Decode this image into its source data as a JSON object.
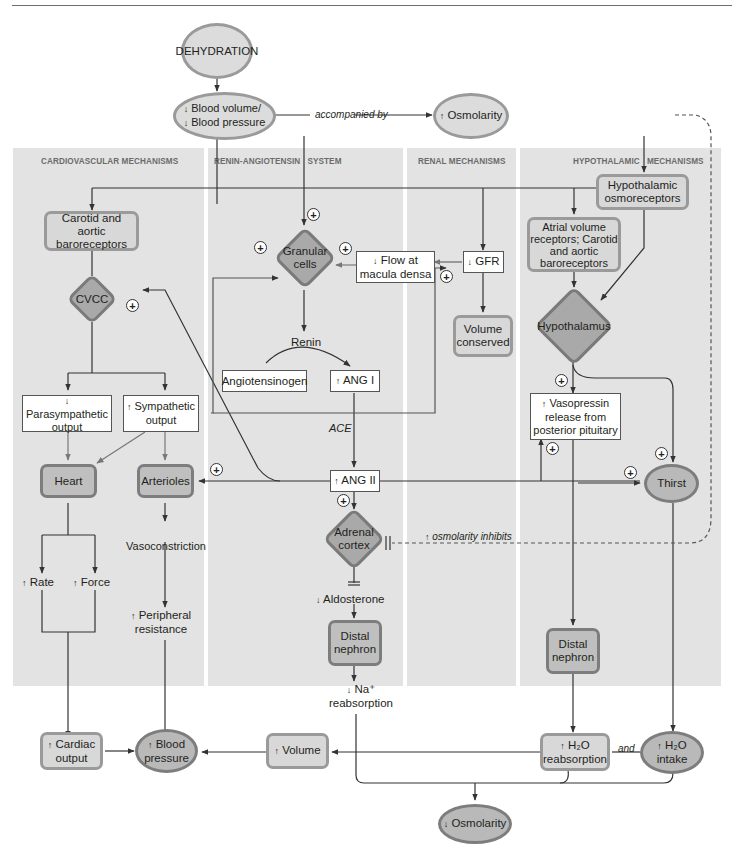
{
  "diagram": {
    "colors": {
      "band_background": "#e3e3e3",
      "node_light": "#dcdcdc",
      "node_dark": "#b9b9b9",
      "diamond_fill": "#a9a9a9",
      "border": "#9a9a9a",
      "line": "#333333",
      "section_title": "#6b6b6b"
    },
    "sections": [
      {
        "id": "cardiovascular",
        "title": "CARDIOVASCULAR MECHANISMS"
      },
      {
        "id": "renin",
        "title": "RENIN-ANGIOTENSIN   SYSTEM"
      },
      {
        "id": "renal",
        "title": "RENAL MECHANISMS"
      },
      {
        "id": "hypothalamic",
        "title": "HYPOTHALAMIC   MECHANISMS"
      }
    ],
    "nodes": {
      "dehydration": "DEHYDRATION",
      "blood_volume": {
        "line1": "Blood volume/",
        "line2": "Blood pressure",
        "direction": "down"
      },
      "accompanied_by": "accompanied by",
      "osmolarity_up": {
        "text": "Osmolarity",
        "direction": "up"
      },
      "carotid_baro": {
        "line1": "Carotid and aortic",
        "line2": "baroreceptors"
      },
      "cvcc": "CVCC",
      "parasympathetic": {
        "line1": "Parasympathetic",
        "line2": "output",
        "direction": "down"
      },
      "sympathetic": {
        "line1": "Sympathetic",
        "line2": "output",
        "direction": "up"
      },
      "heart": "Heart",
      "arterioles": "Arterioles",
      "rate": {
        "text": "Rate",
        "direction": "up"
      },
      "force": {
        "text": "Force",
        "direction": "up"
      },
      "vasoconstriction": "Vasoconstriction",
      "peripheral_resistance": {
        "line1": "Peripheral",
        "line2": "resistance",
        "direction": "up"
      },
      "granular_cells": {
        "line1": "Granular",
        "line2": "cells"
      },
      "flow_macula": {
        "line1": "Flow at",
        "line2": "macula densa",
        "direction": "down"
      },
      "gfr": {
        "text": "GFR",
        "direction": "down"
      },
      "volume_conserved": {
        "line1": "Volume",
        "line2": "conserved"
      },
      "renin": "Renin",
      "angiotensinogen": "Angiotensinogen",
      "ang1": {
        "text": "ANG I",
        "direction": "up"
      },
      "ace": "ACE",
      "ang2": {
        "text": "ANG II",
        "direction": "up"
      },
      "adrenal_cortex": {
        "line1": "Adrenal",
        "line2": "cortex"
      },
      "osmolarity_inhibits": {
        "text": "osmolarity inhibits",
        "direction": "up"
      },
      "aldosterone": {
        "text": "Aldosterone",
        "direction": "down"
      },
      "distal_nephron_left": {
        "line1": "Distal",
        "line2": "nephron"
      },
      "na_reabsorption": {
        "line1": "Na⁺",
        "line2": "reabsorption",
        "direction": "down"
      },
      "hypothalamic_osmo": {
        "line1": "Hypothalamic",
        "line2": "osmoreceptors"
      },
      "atrial_receptors": {
        "line1": "Atrial volume",
        "line2": "receptors; Carotid",
        "line3": "and aortic",
        "line4": "baroreceptors"
      },
      "hypothalamus": "Hypothalamus",
      "vasopressin": {
        "line1": "Vasopressin",
        "line2": "release from",
        "line3": "posterior pituitary",
        "direction": "up"
      },
      "thirst": "Thirst",
      "distal_nephron_right": {
        "line1": "Distal",
        "line2": "nephron"
      },
      "cardiac_output": {
        "line1": "Cardiac",
        "line2": "output",
        "direction": "up"
      },
      "blood_pressure": {
        "line1": "Blood",
        "line2": "pressure",
        "direction": "up"
      },
      "volume_up": {
        "text": "Volume",
        "direction": "up"
      },
      "h2o_reabsorption": {
        "line1": "H₂O",
        "line2": "reabsorption",
        "direction": "up"
      },
      "and": "and",
      "h2o_intake": {
        "line1": "H₂O",
        "line2": "intake",
        "direction": "up"
      },
      "osmolarity_down": {
        "text": "Osmolarity",
        "direction": "down"
      }
    },
    "glyphs": {
      "up_arrow": "↑",
      "down_arrow": "↓",
      "plus": "+"
    }
  }
}
